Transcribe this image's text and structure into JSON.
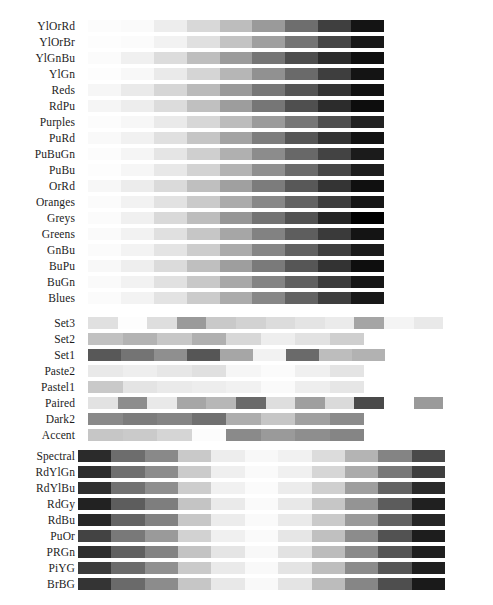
{
  "figure": {
    "title": "",
    "background": "#ffffff",
    "label_color": "#1c1c1c"
  },
  "chart_data": {
    "type": "heatmap",
    "title": "",
    "subtitle": "",
    "xlabel": "",
    "ylabel": "",
    "legend": "none",
    "grid": false,
    "groups": [
      {
        "name": "sequential",
        "label": "",
        "top": 18,
        "bar_left": 88,
        "bar_width": 296,
        "segments": 9,
        "rows": [
          {
            "label": "YlOrRd",
            "values": [
              252,
              254,
              253,
              253,
              252,
              253,
              227,
              189,
              128
            ],
            "greys": [
              "#fcfcfc",
              "#fafafa",
              "#ededed",
              "#d8d8d8",
              "#bdbdbd",
              "#9a9a9a",
              "#6e6e6e",
              "#3f3f3f",
              "#141414"
            ]
          },
          {
            "label": "YlOrBr",
            "values": [
              255,
              254,
              254,
              254,
              236,
              204,
              153,
              102,
              82
            ],
            "greys": [
              "#fdfdfd",
              "#fbfbfb",
              "#f2f2f2",
              "#e0e0e0",
              "#c3c3c3",
              "#9f9f9f",
              "#747474",
              "#454545",
              "#181818"
            ]
          },
          {
            "label": "YlGnBu",
            "values": [
              255,
              237,
              199,
              127,
              65,
              29,
              34,
              37,
              8
            ],
            "greys": [
              "#fbfbfb",
              "#f0f0f0",
              "#dcdcdc",
              "#bebebe",
              "#9b9b9b",
              "#757575",
              "#4d4d4d",
              "#2b2b2b",
              "#0f0f0f"
            ]
          },
          {
            "label": "YlGn",
            "values": [
              255,
              247,
              217,
              173,
              120,
              65,
              35,
              0,
              0
            ],
            "greys": [
              "#fdfdfd",
              "#f8f8f8",
              "#eaeaea",
              "#d5d5d5",
              "#b6b6b6",
              "#919191",
              "#6a6a6a",
              "#3e3e3e",
              "#141414"
            ]
          },
          {
            "label": "Reds",
            "values": [
              255,
              254,
              252,
              252,
              251,
              239,
              203,
              165,
              103
            ],
            "greys": [
              "#f6f6f6",
              "#eaeaea",
              "#d6d6d6",
              "#bababa",
              "#9a9a9a",
              "#777777",
              "#555555",
              "#333333",
              "#111111"
            ]
          },
          {
            "label": "RdPu",
            "values": [
              255,
              253,
              252,
              250,
              247,
              221,
              174,
              122,
              73
            ],
            "greys": [
              "#f5f5f5",
              "#ededed",
              "#dcdcdc",
              "#c0c0c0",
              "#9d9d9d",
              "#767676",
              "#4f4f4f",
              "#2c2c2c",
              "#0d0d0d"
            ]
          },
          {
            "label": "Purples",
            "values": [
              252,
              239,
              218,
              188,
              158,
              128,
              106,
              84,
              63
            ],
            "greys": [
              "#fcfcfc",
              "#f7f7f7",
              "#eaeaea",
              "#d7d7d7",
              "#bcbcbc",
              "#9b9b9b",
              "#777777",
              "#4f4f4f",
              "#222222"
            ]
          },
          {
            "label": "PuRd",
            "values": [
              247,
              231,
              212,
              201,
              223,
              231,
              206,
              152,
              103
            ],
            "greys": [
              "#f9f9f9",
              "#f1f1f1",
              "#e0e0e0",
              "#c5c5c5",
              "#a3a3a3",
              "#7d7d7d",
              "#565656",
              "#333333",
              "#121212"
            ]
          },
          {
            "label": "PuBuGn",
            "values": [
              255,
              236,
              208,
              166,
              103,
              54,
              2,
              1,
              1
            ],
            "greys": [
              "#fcfcfc",
              "#f5f5f5",
              "#e5e5e5",
              "#cfcfcf",
              "#b0b0b0",
              "#8c8c8c",
              "#686868",
              "#434343",
              "#1b1b1b"
            ]
          },
          {
            "label": "PuBu",
            "values": [
              255,
              236,
              208,
              166,
              116,
              54,
              5,
              4,
              2
            ],
            "greys": [
              "#fdfdfd",
              "#f6f6f6",
              "#e8e8e8",
              "#d3d3d3",
              "#b4b4b4",
              "#909090",
              "#6b6b6b",
              "#464646",
              "#1d1d1d"
            ]
          },
          {
            "label": "OrRd",
            "values": [
              255,
              254,
              253,
              253,
              252,
              239,
              215,
              179,
              127
            ],
            "greys": [
              "#f7f7f7",
              "#ececec",
              "#dadada",
              "#bfbfbf",
              "#a0a0a0",
              "#7c7c7c",
              "#585858",
              "#343434",
              "#101010"
            ]
          },
          {
            "label": "Oranges",
            "values": [
              255,
              254,
              253,
              253,
              241,
              217,
              166,
              140,
              127
            ],
            "greys": [
              "#fbfbfb",
              "#f2f2f2",
              "#e2e2e2",
              "#cacaca",
              "#ababab",
              "#888888",
              "#636363",
              "#3e3e3e",
              "#161616"
            ]
          },
          {
            "label": "Greys",
            "values": [
              255,
              240,
              217,
              189,
              150,
              115,
              82,
              37,
              0
            ],
            "greys": [
              "#fbfbfb",
              "#f0f0f0",
              "#d9d9d9",
              "#bdbdbd",
              "#969696",
              "#737373",
              "#525252",
              "#252525",
              "#000000"
            ]
          },
          {
            "label": "Greens",
            "values": [
              247,
              229,
              199,
              161,
              116,
              65,
              35,
              0,
              0
            ],
            "greys": [
              "#fafafa",
              "#f2f2f2",
              "#e0e0e0",
              "#c6c6c6",
              "#a6a6a6",
              "#828282",
              "#5e5e5e",
              "#3a3a3a",
              "#141414"
            ]
          },
          {
            "label": "GnBu",
            "values": [
              247,
              224,
              204,
              168,
              123,
              78,
              43,
              8,
              8
            ],
            "greys": [
              "#fbfbfb",
              "#f3f3f3",
              "#e4e4e4",
              "#cdcdcd",
              "#ababab",
              "#868686",
              "#616161",
              "#3e3e3e",
              "#1a1a1a"
            ]
          },
          {
            "label": "BuPu",
            "values": [
              247,
              224,
              191,
              158,
              140,
              140,
              136,
              129,
              77
            ],
            "greys": [
              "#f8f8f8",
              "#eeeeee",
              "#dbdbdb",
              "#bfbfbf",
              "#9e9e9e",
              "#7a7a7a",
              "#565656",
              "#333333",
              "#0e0e0e"
            ]
          },
          {
            "label": "BuGn",
            "values": [
              247,
              229,
              204,
              153,
              102,
              65,
              35,
              0,
              0
            ],
            "greys": [
              "#fafafa",
              "#f2f2f2",
              "#e1e1e1",
              "#c8c8c8",
              "#a8a8a8",
              "#848484",
              "#606060",
              "#3c3c3c",
              "#161616"
            ]
          },
          {
            "label": "Blues",
            "values": [
              247,
              222,
              198,
              158,
              107,
              66,
              33,
              8,
              8
            ],
            "greys": [
              "#fbfbfb",
              "#f3f3f3",
              "#e3e3e3",
              "#cbcbcb",
              "#ababab",
              "#878787",
              "#626262",
              "#3e3e3e",
              "#181818"
            ]
          }
        ]
      },
      {
        "name": "qualitative",
        "label": "",
        "top": 315,
        "rows": [
          {
            "label": "Set3",
            "bar_left": 88,
            "seg_width": 29.6,
            "greys": [
              "#e0e0e0",
              "#fdfdfd",
              "#dedede",
              "#9a9a9a",
              "#c9c9c9",
              "#d2d2d2",
              "#dcdcdc",
              "#e4e4e4",
              "#ebebeb",
              "#a5a5a5",
              "#f4f4f4",
              "#e9e9e9"
            ]
          },
          {
            "label": "Set2",
            "bar_left": 88,
            "seg_width": 34.5,
            "greys": [
              "#c1c1c1",
              "#b3b3b3",
              "#c7c7c7",
              "#b0b0b0",
              "#d8d8d8",
              "#eeeeee",
              "#e2e2e2",
              "#cfcfcf"
            ]
          },
          {
            "label": "Set1",
            "bar_left": 88,
            "seg_width": 33.0,
            "greys": [
              "#585858",
              "#747474",
              "#8f8f8f",
              "#565656",
              "#a6a6a6",
              "#f2f2f2",
              "#6a6a6a",
              "#bdbdbd",
              "#b2b2b2"
            ]
          },
          {
            "label": "Paste2",
            "bar_left": 88,
            "seg_width": 34.5,
            "greys": [
              "#e9e9e9",
              "#eeeeee",
              "#e7e7e7",
              "#e0e0e0",
              "#f6f6f6",
              "#fbfbfb",
              "#f0f0f0",
              "#e4e4e4"
            ]
          },
          {
            "label": "Pastel1",
            "bar_left": 88,
            "seg_width": 34.5,
            "greys": [
              "#c9c9c9",
              "#e4e4e4",
              "#eaeaea",
              "#ededed",
              "#f1f1f1",
              "#fafafa",
              "#eeeeee",
              "#e6e6e6"
            ]
          },
          {
            "label": "Paired",
            "bar_left": 88,
            "seg_width": 29.6,
            "greys": [
              "#e2e2e2",
              "#8d8d8d",
              "#e9e9e9",
              "#a6a6a6",
              "#b7b7b7",
              "#6a6a6a",
              "#dedede",
              "#9f9f9f",
              "#dadada",
              "#4a4a4a",
              "#ffffff",
              "#9a9a9a"
            ]
          },
          {
            "label": "Dark2",
            "bar_left": 88,
            "seg_width": 34.5,
            "greys": [
              "#898989",
              "#7c7c7c",
              "#848484",
              "#707070",
              "#adadad",
              "#c6c6c6",
              "#a0a0a0",
              "#8b8b8b"
            ]
          },
          {
            "label": "Accent",
            "bar_left": 88,
            "seg_width": 34.5,
            "greys": [
              "#c6c6c6",
              "#cacaca",
              "#d5d5d5",
              "#fcfcfc",
              "#8a8a8a",
              "#9a9a9a",
              "#8e8e8e",
              "#858585"
            ]
          }
        ]
      },
      {
        "name": "diverging",
        "label": "",
        "top": 448,
        "bar_left": 78,
        "bar_width": 367,
        "segments": 11,
        "rows": [
          {
            "label": "Spectral",
            "greys": [
              "#2b2b2b",
              "#6d6d6d",
              "#898989",
              "#c9c9c9",
              "#ededed",
              "#f8f8f8",
              "#f1f1f1",
              "#dcdcdc",
              "#b4b4b4",
              "#848484",
              "#4a4a4a"
            ]
          },
          {
            "label": "RdYlGn",
            "greys": [
              "#2d2d2d",
              "#6f6f6f",
              "#8c8c8c",
              "#cbcbcb",
              "#efefef",
              "#fafafa",
              "#f0f0f0",
              "#d6d6d6",
              "#ababab",
              "#787878",
              "#3f3f3f"
            ]
          },
          {
            "label": "RdYlBu",
            "greys": [
              "#2f2f2f",
              "#717171",
              "#8e8e8e",
              "#cdcdcd",
              "#f1f1f1",
              "#fbfbfb",
              "#ececec",
              "#cfcfcf",
              "#9e9e9e",
              "#636363",
              "#2a2a2a"
            ]
          },
          {
            "label": "RdGy",
            "greys": [
              "#222222",
              "#5d5d5d",
              "#7e7e7e",
              "#c4c4c4",
              "#eaeaea",
              "#fafafa",
              "#e8e8e8",
              "#c6c6c6",
              "#949494",
              "#5c5c5c",
              "#202020"
            ]
          },
          {
            "label": "RdBu",
            "greys": [
              "#272727",
              "#636363",
              "#828282",
              "#c7c7c7",
              "#ececec",
              "#fafafa",
              "#eaeaea",
              "#cacaca",
              "#9a9a9a",
              "#626262",
              "#262626"
            ]
          },
          {
            "label": "PuOr",
            "greys": [
              "#434343",
              "#797979",
              "#9a9a9a",
              "#d2d2d2",
              "#f0f0f0",
              "#fafafa",
              "#e6e6e6",
              "#c0c0c0",
              "#8c8c8c",
              "#525252",
              "#1d1d1d"
            ]
          },
          {
            "label": "PRGn",
            "greys": [
              "#2e2e2e",
              "#606060",
              "#838383",
              "#c3c3c3",
              "#e5e5e5",
              "#f8f8f8",
              "#e2e2e2",
              "#bcbcbc",
              "#8a8a8a",
              "#555555",
              "#1f1f1f"
            ]
          },
          {
            "label": "PiYG",
            "greys": [
              "#3b3b3b",
              "#6b6b6b",
              "#909090",
              "#cacaca",
              "#eaeaea",
              "#f9f9f9",
              "#e4e4e4",
              "#bebebe",
              "#8b8b8b",
              "#565656",
              "#1f1f1f"
            ]
          },
          {
            "label": "BrBG",
            "greys": [
              "#343434",
              "#6a6a6a",
              "#8c8c8c",
              "#c6c6c6",
              "#e8e8e8",
              "#f9f9f9",
              "#e4e4e4",
              "#bcbcbc",
              "#868686",
              "#4e4e4e",
              "#1a1a1a"
            ]
          }
        ]
      }
    ]
  }
}
